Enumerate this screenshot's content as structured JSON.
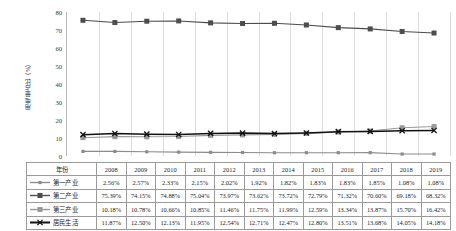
{
  "chart_data": {
    "type": "line",
    "title": "",
    "xlabel": "",
    "ylabel": "用电量占比（%）",
    "categories": [
      "2008",
      "2009",
      "2010",
      "2011",
      "2012",
      "2013",
      "2014",
      "2015",
      "2016",
      "2017",
      "2018",
      "2019"
    ],
    "ylim": [
      0,
      80
    ],
    "yticks": [
      0,
      10,
      20,
      30,
      40,
      50,
      60,
      70,
      80
    ],
    "grid": "vertical-only",
    "legend": "table-row-headers",
    "series": [
      {
        "name": "第一产业",
        "marker": "small-square",
        "color": "#8c8c8c",
        "values": [
          2.56,
          2.57,
          2.33,
          2.15,
          2.02,
          1.92,
          1.82,
          1.83,
          1.83,
          1.85,
          1.08,
          1.08
        ],
        "labels": [
          "2.56%",
          "2.57%",
          "2.33%",
          "2.15%",
          "2.02%",
          "1.92%",
          "1.82%",
          "1.83%",
          "1.83%",
          "1.85%",
          "1.08%",
          "1.08%"
        ]
      },
      {
        "name": "第二产业",
        "marker": "square",
        "color": "#4d4d4d",
        "values": [
          75.39,
          74.15,
          74.88,
          75.04,
          73.97,
          73.62,
          73.72,
          72.79,
          71.32,
          70.6,
          69.18,
          68.32
        ],
        "labels": [
          "75.39%",
          "74.15%",
          "74.88%",
          "75.04%",
          "73.97%",
          "73.62%",
          "73.72%",
          "72.79%",
          "71.32%",
          "70.60%",
          "69.18%",
          "68.32%"
        ]
      },
      {
        "name": "第三产业",
        "marker": "square",
        "color": "#999999",
        "values": [
          10.18,
          10.78,
          10.66,
          10.85,
          11.46,
          11.75,
          11.99,
          12.59,
          13.34,
          13.87,
          15.7,
          16.42
        ],
        "labels": [
          "10.18%",
          "10.78%",
          "10.66%",
          "10.85%",
          "11.46%",
          "11.75%",
          "11.99%",
          "12.59%",
          "13.34%",
          "13.87%",
          "15.70%",
          "16.42%"
        ]
      },
      {
        "name": "居民生活",
        "marker": "x-cross",
        "color": "#111111",
        "values": [
          11.87,
          12.5,
          12.13,
          11.95,
          12.54,
          12.71,
          12.47,
          12.8,
          13.51,
          13.68,
          14.05,
          14.18
        ],
        "labels": [
          "11.87%",
          "12.50%",
          "12.13%",
          "11.95%",
          "12.54%",
          "12.71%",
          "12.47%",
          "12.80%",
          "13.51%",
          "13.68%",
          "14.05%",
          "14.18%"
        ]
      }
    ]
  },
  "table": {
    "corner_header": "年份",
    "columns": [
      "2008",
      "2009",
      "2010",
      "2011",
      "2012",
      "2013",
      "2014",
      "2015",
      "2016",
      "2017",
      "2018",
      "2019"
    ],
    "rows": [
      {
        "label": "第一产业",
        "marker": "small-square",
        "color": "#8c8c8c",
        "values": [
          "2.56%",
          "2.57%",
          "2.33%",
          "2.15%",
          "2.02%",
          "1.92%",
          "1.82%",
          "1.83%",
          "1.83%",
          "1.85%",
          "1.08%",
          "1.08%"
        ]
      },
      {
        "label": "第二产业",
        "marker": "square",
        "color": "#4d4d4d",
        "values": [
          "75.39%",
          "74.15%",
          "74.88%",
          "75.04%",
          "73.97%",
          "73.62%",
          "73.72%",
          "72.79%",
          "71.32%",
          "70.60%",
          "69.18%",
          "68.32%"
        ]
      },
      {
        "label": "第三产业",
        "marker": "square",
        "color": "#999999",
        "values": [
          "10.18%",
          "10.78%",
          "10.66%",
          "10.85%",
          "11.46%",
          "11.75%",
          "11.99%",
          "12.59%",
          "13.34%",
          "13.87%",
          "15.70%",
          "16.42%"
        ]
      },
      {
        "label": "居民生活",
        "marker": "x-cross",
        "color": "#111111",
        "values": [
          "11.87%",
          "12.50%",
          "12.13%",
          "11.95%",
          "12.54%",
          "12.71%",
          "12.47%",
          "12.80%",
          "13.51%",
          "13.68%",
          "14.05%",
          "14.18%"
        ]
      }
    ]
  }
}
